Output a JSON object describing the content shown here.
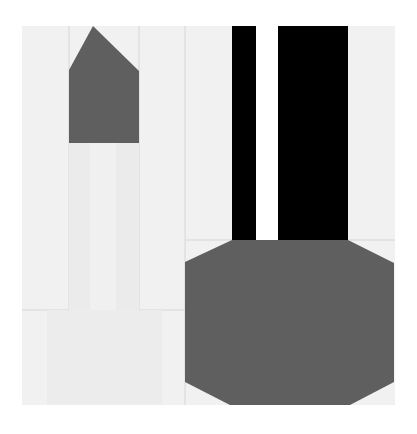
{
  "figure": {
    "width": 417,
    "height": 434,
    "background": "#ffffff",
    "panel": {
      "x": 22,
      "y": 26,
      "w": 373,
      "h": 379,
      "fill": "#f1f1f1",
      "grid_line": "#d6d6d6"
    },
    "colors": {
      "dark_gray": "#5f5f5f",
      "black": "#000000",
      "white": "#ffffff",
      "light_stem": "#ebebeb",
      "light_band": "#efefef",
      "base_fill": "#ececec"
    },
    "shapes": [
      {
        "name": "pentagon-tip",
        "type": "polygon",
        "points": "69,70 93,26 139,71 139,143 69,143",
        "fill": "#5f5f5f"
      },
      {
        "name": "stem",
        "type": "rect",
        "x": 69,
        "y": 143,
        "w": 70,
        "h": 167,
        "fill": "#ebebeb"
      },
      {
        "name": "stem-band",
        "type": "rect",
        "x": 90,
        "y": 143,
        "w": 26,
        "h": 167,
        "fill": "#f0f0f0"
      },
      {
        "name": "base",
        "type": "rect",
        "x": 47,
        "y": 310,
        "w": 115,
        "h": 95,
        "fill": "#ececec"
      },
      {
        "name": "black-bar-left",
        "type": "rect",
        "x": 232,
        "y": 26,
        "w": 24,
        "h": 214,
        "fill": "#000000"
      },
      {
        "name": "white-gap",
        "type": "rect",
        "x": 256,
        "y": 26,
        "w": 22,
        "h": 214,
        "fill": "#ffffff"
      },
      {
        "name": "black-bar-right",
        "type": "rect",
        "x": 278,
        "y": 26,
        "w": 70,
        "h": 214,
        "fill": "#000000"
      },
      {
        "name": "octagon",
        "type": "polygon",
        "points": "232,240 348,240 394,263 394,382 350,405 230,405 185,382 185,262",
        "fill": "#5f5f5f"
      }
    ],
    "grid_lines": [
      {
        "x1": 69,
        "y1": 26,
        "x2": 69,
        "y2": 405
      },
      {
        "x1": 139,
        "y1": 26,
        "x2": 139,
        "y2": 405
      },
      {
        "x1": 185,
        "y1": 26,
        "x2": 185,
        "y2": 405
      },
      {
        "x1": 22,
        "y1": 310,
        "x2": 185,
        "y2": 310
      },
      {
        "x1": 185,
        "y1": 240,
        "x2": 395,
        "y2": 240
      }
    ]
  }
}
